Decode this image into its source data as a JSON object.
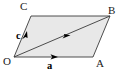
{
  "figure": {
    "type": "vector-parallelogram-diagram",
    "background_color": "#ffffff",
    "fill_color": "#e8e8e8",
    "stroke_color": "#3a3a3a",
    "vertices": [
      {
        "id": "O",
        "label": "O",
        "x": 14,
        "y": 57
      },
      {
        "id": "A",
        "label": "A",
        "x": 93,
        "y": 57
      },
      {
        "id": "B",
        "label": "B",
        "x": 110,
        "y": 16
      },
      {
        "id": "C",
        "label": "C",
        "x": 31,
        "y": 16
      }
    ],
    "vectors": [
      {
        "id": "a",
        "label": "a",
        "from": "O",
        "to": "A",
        "bold": true,
        "arrow_at": {
          "x": 55,
          "y": 57
        }
      },
      {
        "id": "c",
        "label": "c",
        "from": "O",
        "to": "C",
        "bold": true,
        "arrow_at": {
          "x": 24,
          "y": 35
        }
      },
      {
        "id": "diagonal",
        "label": "",
        "from": "O",
        "to": "B",
        "bold": false,
        "arrow_at": {
          "x": 67,
          "y": 36
        }
      }
    ],
    "edges": [
      {
        "from": "O",
        "to": "A"
      },
      {
        "from": "A",
        "to": "B"
      },
      {
        "from": "B",
        "to": "C"
      },
      {
        "from": "C",
        "to": "O"
      }
    ]
  }
}
